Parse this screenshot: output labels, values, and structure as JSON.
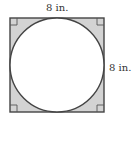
{
  "diagram": {
    "type": "geometry",
    "shapes": {
      "square": {
        "x": 10,
        "y": 18,
        "side": 94,
        "fill": "#d3d3d3",
        "stroke": "#444444"
      },
      "circle": {
        "cx": 57,
        "cy": 65,
        "r": 47,
        "fill": "#ffffff",
        "stroke": "#444444"
      },
      "right_angle_marks": [
        "top-left",
        "top-right",
        "bottom-left",
        "bottom-right"
      ]
    },
    "labels": {
      "top_side": "8 in.",
      "right_side": "8 in."
    },
    "colors": {
      "shaded_region": "#d3d3d3",
      "outline": "#444444",
      "circle_fill": "#ffffff",
      "text": "#333333"
    }
  }
}
